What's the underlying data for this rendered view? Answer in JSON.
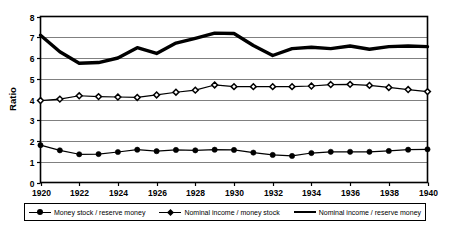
{
  "chart_data": {
    "type": "line",
    "title": "",
    "xlabel": "",
    "ylabel": "Ratio",
    "xlim": [
      1920,
      1940
    ],
    "ylim": [
      0,
      8
    ],
    "ytick_step": 1,
    "xtick_step": 2,
    "grid": true,
    "legend_position": "bottom",
    "x": [
      1920,
      1921,
      1922,
      1923,
      1924,
      1925,
      1926,
      1927,
      1928,
      1929,
      1930,
      1931,
      1932,
      1933,
      1934,
      1935,
      1936,
      1937,
      1938,
      1939,
      1940
    ],
    "xtick_labels": [
      "1920",
      "1922",
      "1924",
      "1926",
      "1928",
      "1930",
      "1932",
      "1934",
      "1936",
      "1938",
      "1940"
    ],
    "ytick_labels": [
      "0",
      "1",
      "2",
      "3",
      "4",
      "5",
      "6",
      "7",
      "8"
    ],
    "series": [
      {
        "name": "Money stock / reserve money",
        "marker": "circle",
        "line_width": 1.2,
        "color": "#000000",
        "values": [
          1.8,
          1.55,
          1.36,
          1.37,
          1.47,
          1.58,
          1.51,
          1.57,
          1.55,
          1.58,
          1.57,
          1.44,
          1.33,
          1.28,
          1.42,
          1.48,
          1.48,
          1.48,
          1.52,
          1.58,
          1.6
        ]
      },
      {
        "name": "Nominal income / money stock",
        "marker": "diamond",
        "line_width": 1.2,
        "color": "#000000",
        "values": [
          3.95,
          4.02,
          4.18,
          4.14,
          4.12,
          4.1,
          4.22,
          4.35,
          4.45,
          4.7,
          4.62,
          4.62,
          4.62,
          4.62,
          4.65,
          4.72,
          4.73,
          4.68,
          4.58,
          4.48,
          4.38
        ]
      },
      {
        "name": "Nominal income / reserve money",
        "marker": "none",
        "line_width": 3.4,
        "color": "#000000",
        "values": [
          7.1,
          6.3,
          5.75,
          5.78,
          6.0,
          6.5,
          6.22,
          6.72,
          6.95,
          7.2,
          7.18,
          6.6,
          6.12,
          6.45,
          6.52,
          6.45,
          6.58,
          6.42,
          6.55,
          6.58,
          6.55
        ]
      }
    ]
  },
  "legend": {
    "entries": [
      {
        "label": "Money stock / reserve money"
      },
      {
        "label": "Nominal income / money stock"
      },
      {
        "label": "Nominal income / reserve money"
      }
    ]
  },
  "axis": {
    "y_title": "Ratio"
  },
  "style": {
    "frame_color": "#000000",
    "grid_color": "#808080",
    "background": "#ffffff"
  }
}
